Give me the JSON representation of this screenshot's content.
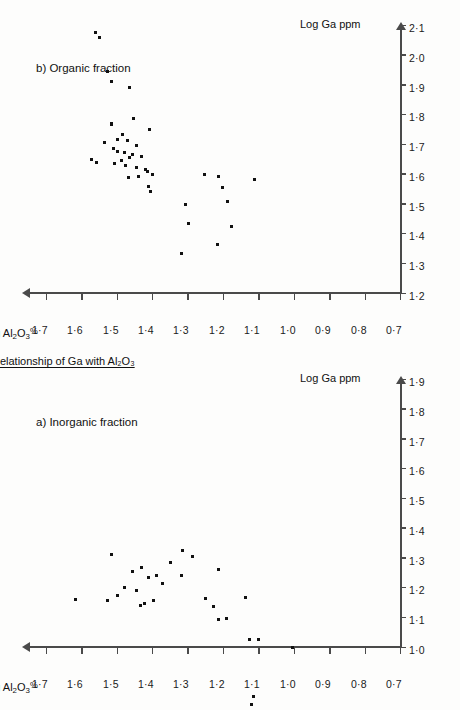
{
  "figure": {
    "main_title": "Relationship of Ga with Al₂O₃",
    "axis_x_title": "Log Ga ppm",
    "axis_y_title_text": "Log Al₂O₃%",
    "axis_y_title_prefix": "Log Al",
    "axis_y_title_sub1": "2",
    "axis_y_title_mid": "O",
    "axis_y_title_sub2": "3",
    "axis_y_title_suffix": "%"
  },
  "panels": [
    {
      "id": "a",
      "label": "a) Inorganic fraction",
      "axis_x_title": "Log Ga ppm",
      "axis_y_title": "Log Al₂O₃%"
    },
    {
      "id": "b",
      "label": "b) Organic fraction",
      "axis_x_title": "Log Ga ppm",
      "axis_y_title": "Log Al₂O₃%"
    }
  ],
  "chart_data": [
    {
      "type": "scatter",
      "panel": "a",
      "title": "a) Inorganic fraction",
      "xlabel": "Log Ga ppm",
      "ylabel": "Log Al2O3%",
      "xlim": [
        1.0,
        1.9
      ],
      "ylim": [
        0.7,
        1.75
      ],
      "xticks": [
        1.0,
        1.1,
        1.2,
        1.3,
        1.4,
        1.5,
        1.6,
        1.7,
        1.8,
        1.9
      ],
      "xticklabels": [
        "1·0",
        "1·1",
        "1·2",
        "1·3",
        "1·4",
        "1·5",
        "1·6",
        "1·7",
        "1·8",
        "1·9"
      ],
      "yticks": [
        0.7,
        0.8,
        0.9,
        1.0,
        1.1,
        1.2,
        1.3,
        1.4,
        1.5,
        1.6,
        1.7
      ],
      "yticklabels": [
        "0·7",
        "0·8",
        "0·9",
        "1·0",
        "1·1",
        "1·2",
        "1·3",
        "1·4",
        "1·5",
        "1·6",
        "1·7"
      ],
      "grid": false,
      "legend": "none",
      "points": [
        [
          1.162,
          1.617
        ],
        [
          1.16,
          1.526
        ],
        [
          1.176,
          1.496
        ],
        [
          1.203,
          1.479
        ],
        [
          1.193,
          1.445
        ],
        [
          1.142,
          1.432
        ],
        [
          1.148,
          1.421
        ],
        [
          1.158,
          1.395
        ],
        [
          1.314,
          1.513
        ],
        [
          1.258,
          1.455
        ],
        [
          1.27,
          1.429
        ],
        [
          1.238,
          1.41
        ],
        [
          1.243,
          1.386
        ],
        [
          1.215,
          1.371
        ],
        [
          1.288,
          1.348
        ],
        [
          1.243,
          1.318
        ],
        [
          1.327,
          1.313
        ],
        [
          1.308,
          1.286
        ],
        [
          1.166,
          1.25
        ],
        [
          1.14,
          1.227
        ],
        [
          1.265,
          1.213
        ],
        [
          1.17,
          1.135
        ],
        [
          1.095,
          1.212
        ],
        [
          1.098,
          1.19
        ],
        [
          1.027,
          1.126
        ],
        [
          1.03,
          1.098
        ],
        [
          1.0,
          1.003
        ],
        [
          0.81,
          1.118
        ],
        [
          0.836,
          1.114
        ]
      ]
    },
    {
      "type": "scatter",
      "panel": "b",
      "title": "b) Organic fraction",
      "xlabel": "Log Ga ppm",
      "ylabel": "Log Al2O3%",
      "xlim": [
        1.2,
        2.1
      ],
      "ylim": [
        0.7,
        1.75
      ],
      "xticks": [
        1.2,
        1.3,
        1.4,
        1.5,
        1.6,
        1.7,
        1.8,
        1.9,
        2.0,
        2.1
      ],
      "xticklabels": [
        "1·2",
        "1·3",
        "1·4",
        "1·5",
        "1·6",
        "1·7",
        "1·8",
        "1·9",
        "2·0",
        "2·1"
      ],
      "yticks": [
        0.7,
        0.8,
        0.9,
        1.0,
        1.1,
        1.2,
        1.3,
        1.4,
        1.5,
        1.6,
        1.7
      ],
      "yticklabels": [
        "0·7",
        "0·8",
        "0·9",
        "1·0",
        "1·1",
        "1·2",
        "1·3",
        "1·4",
        "1·5",
        "1·6",
        "1·7"
      ],
      "grid": false,
      "legend": "none",
      "points": [
        [
          2.078,
          1.56
        ],
        [
          2.06,
          1.548
        ],
        [
          1.948,
          1.527
        ],
        [
          1.915,
          1.514
        ],
        [
          1.895,
          1.463
        ],
        [
          1.79,
          1.452
        ],
        [
          1.752,
          1.407
        ],
        [
          1.772,
          1.513
        ],
        [
          1.77,
          1.515
        ],
        [
          1.737,
          1.483
        ],
        [
          1.717,
          1.469
        ],
        [
          1.72,
          1.498
        ],
        [
          1.708,
          1.533
        ],
        [
          1.7,
          1.443
        ],
        [
          1.69,
          1.508
        ],
        [
          1.677,
          1.497
        ],
        [
          1.675,
          1.478
        ],
        [
          1.668,
          1.455
        ],
        [
          1.663,
          1.43
        ],
        [
          1.66,
          1.463
        ],
        [
          1.652,
          1.57
        ],
        [
          1.648,
          1.487
        ],
        [
          1.64,
          1.558
        ],
        [
          1.638,
          1.506
        ],
        [
          1.63,
          1.474
        ],
        [
          1.625,
          1.444
        ],
        [
          1.618,
          1.418
        ],
        [
          1.61,
          1.413
        ],
        [
          1.6,
          1.4
        ],
        [
          1.596,
          1.439
        ],
        [
          1.592,
          1.465
        ],
        [
          1.56,
          1.409
        ],
        [
          1.545,
          1.405
        ],
        [
          1.6,
          1.253
        ],
        [
          1.596,
          1.211
        ],
        [
          1.558,
          1.2
        ],
        [
          1.5,
          1.305
        ],
        [
          1.512,
          1.188
        ],
        [
          1.438,
          1.297
        ],
        [
          1.425,
          1.176
        ],
        [
          1.335,
          1.318
        ],
        [
          1.365,
          1.216
        ],
        [
          1.584,
          1.11
        ]
      ]
    }
  ]
}
